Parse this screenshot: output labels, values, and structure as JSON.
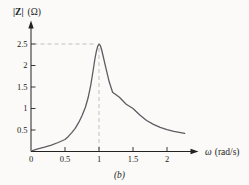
{
  "figure": {
    "ylabel_main": "|Z|",
    "ylabel_unit": "(Ω)",
    "xlabel_symbol": "ω",
    "xlabel_unit": "(rad/s)",
    "caption": "(b)"
  },
  "colors": {
    "curve": "#5c5d63",
    "axis": "#222222",
    "dashed": "#bfbfbf",
    "text": "#1c1c1c",
    "background": "#fbfaf8"
  },
  "chart_data": {
    "type": "line",
    "title": "",
    "xlabel": "ω (rad/s)",
    "ylabel": "|Z| (Ω)",
    "xlim": [
      0,
      2.45
    ],
    "ylim": [
      0,
      3.05
    ],
    "grid": false,
    "x_tick_labels": [
      "0",
      "0.5",
      "1",
      "1.5",
      "2"
    ],
    "x_tick_values": [
      0,
      0.5,
      1,
      1.5,
      2
    ],
    "y_tick_labels": [
      "0.5",
      "1",
      "1.5",
      "2",
      "2.5"
    ],
    "y_tick_values": [
      0.5,
      1,
      1.5,
      2,
      2.5
    ],
    "peak": {
      "omega": 1,
      "z": 2.5
    },
    "guides": {
      "horizontal_at_z": 2.5,
      "vertical_at_omega": 1
    },
    "caption": "(b)",
    "series": [
      {
        "name": "impedance-magnitude",
        "points": [
          [
            0.02,
            0.02
          ],
          [
            0.1,
            0.06
          ],
          [
            0.2,
            0.1
          ],
          [
            0.3,
            0.15
          ],
          [
            0.4,
            0.21
          ],
          [
            0.5,
            0.28
          ],
          [
            0.55,
            0.35
          ],
          [
            0.6,
            0.44
          ],
          [
            0.65,
            0.54
          ],
          [
            0.7,
            0.67
          ],
          [
            0.75,
            0.83
          ],
          [
            0.8,
            1.03
          ],
          [
            0.84,
            1.25
          ],
          [
            0.88,
            1.55
          ],
          [
            0.91,
            1.85
          ],
          [
            0.94,
            2.15
          ],
          [
            0.96,
            2.32
          ],
          [
            0.98,
            2.44
          ],
          [
            1.0,
            2.5
          ],
          [
            1.02,
            2.46
          ],
          [
            1.04,
            2.36
          ],
          [
            1.06,
            2.22
          ],
          [
            1.1,
            1.95
          ],
          [
            1.15,
            1.62
          ],
          [
            1.2,
            1.38
          ],
          [
            1.3,
            1.26
          ],
          [
            1.4,
            1.1
          ],
          [
            1.5,
            1.0
          ],
          [
            1.6,
            0.85
          ],
          [
            1.7,
            0.72
          ],
          [
            1.8,
            0.63
          ],
          [
            1.9,
            0.56
          ],
          [
            2.0,
            0.51
          ],
          [
            2.1,
            0.47
          ],
          [
            2.2,
            0.44
          ],
          [
            2.26,
            0.42
          ]
        ]
      }
    ]
  }
}
